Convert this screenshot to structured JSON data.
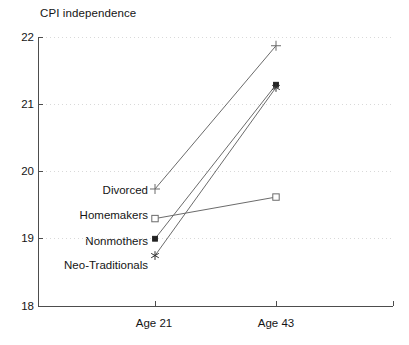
{
  "chart_data": {
    "type": "line",
    "title": "CPI independence",
    "xlabel": "",
    "ylabel": "",
    "categories": [
      "Age 21",
      "Age 43"
    ],
    "x_tick_labels": [
      "Age 21",
      "Age 43"
    ],
    "y_tick_labels": [
      "22",
      "21",
      "20",
      "19",
      "18"
    ],
    "y_ticks": [
      22,
      21,
      20,
      19,
      18
    ],
    "ylim": [
      18,
      22
    ],
    "grid": "horizontal-dotted",
    "legend_position": "inline-left-labels",
    "series": [
      {
        "name": "Divorced",
        "marker": "plus",
        "values": [
          19.74,
          21.87
        ]
      },
      {
        "name": "Homemakers",
        "marker": "open-square",
        "values": [
          19.3,
          19.62
        ]
      },
      {
        "name": "Nonmothers",
        "marker": "filled-square",
        "values": [
          19.0,
          21.29
        ]
      },
      {
        "name": "Neo-Traditionals",
        "marker": "asterisk",
        "values": [
          18.75,
          21.25
        ]
      }
    ],
    "colors": {
      "axis": "#4d4d4d",
      "grid": "#d9d9d9",
      "line": "#6b6b6b",
      "text": "#151515"
    }
  },
  "labels": {
    "title": "CPI independence",
    "y22": "22",
    "y21": "21",
    "y20": "20",
    "y19": "19",
    "y18": "18",
    "x_age21": "Age 21",
    "x_age43": "Age 43",
    "s_divorced": "Divorced",
    "s_homemakers": "Homemakers",
    "s_nonmothers": "Nonmothers",
    "s_neotraditionals": "Neo-Traditionals"
  }
}
